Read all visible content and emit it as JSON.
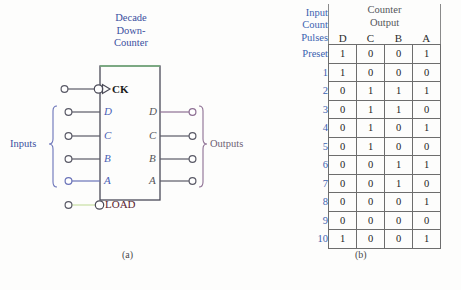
{
  "figure": {
    "panel_a": {
      "caption": "(a)",
      "block_title_lines": [
        "Decade",
        "Down-",
        "Counter"
      ],
      "clock_label": "CK",
      "load_label": "LOAD",
      "inputs_label": "Inputs",
      "outputs_label": "Outputs",
      "input_pins": [
        "D",
        "C",
        "B",
        "A"
      ],
      "output_pins": [
        "D",
        "C",
        "B",
        "A"
      ],
      "colors": {
        "title": "#3b4fa0",
        "pin_label": "#4a5fb5",
        "output_pin_label": "#55565a",
        "load": "#5b2430",
        "inputs_bracket": "#4a5fb5",
        "outputs_bracket": "#8d6f93",
        "box_stroke": "#4b4b58",
        "wire": "#5a5a66",
        "load_wire": "#cfe3b0",
        "top_edge": "#79b47f"
      }
    },
    "panel_b": {
      "caption": "(b)",
      "header": {
        "left_lines": [
          "Input",
          "Count",
          "Pulses"
        ],
        "group_lines": [
          "Counter",
          "Output"
        ],
        "columns": [
          "D",
          "C",
          "B",
          "A"
        ]
      },
      "rows": [
        {
          "pulse": "Preset",
          "bits": [
            "1",
            "0",
            "0",
            "1"
          ]
        },
        {
          "pulse": "1",
          "bits": [
            "1",
            "0",
            "0",
            "0"
          ]
        },
        {
          "pulse": "2",
          "bits": [
            "0",
            "1",
            "1",
            "1"
          ]
        },
        {
          "pulse": "3",
          "bits": [
            "0",
            "1",
            "1",
            "0"
          ]
        },
        {
          "pulse": "4",
          "bits": [
            "0",
            "1",
            "0",
            "1"
          ]
        },
        {
          "pulse": "5",
          "bits": [
            "0",
            "1",
            "0",
            "0"
          ]
        },
        {
          "pulse": "6",
          "bits": [
            "0",
            "0",
            "1",
            "1"
          ]
        },
        {
          "pulse": "7",
          "bits": [
            "0",
            "0",
            "1",
            "0"
          ]
        },
        {
          "pulse": "8",
          "bits": [
            "0",
            "0",
            "0",
            "1"
          ]
        },
        {
          "pulse": "9",
          "bits": [
            "0",
            "0",
            "0",
            "0"
          ]
        },
        {
          "pulse": "10",
          "bits": [
            "1",
            "0",
            "0",
            "1"
          ]
        }
      ],
      "colors": {
        "pulse_text": "#3b62b0",
        "group_header": "#54555a",
        "cell_text": "#222222",
        "grid": "#6d6d6d"
      }
    }
  }
}
